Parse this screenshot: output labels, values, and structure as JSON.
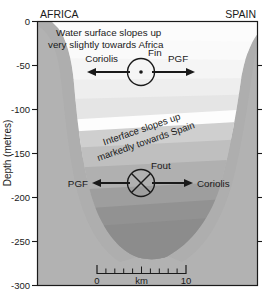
{
  "figure": {
    "type": "cross-section-diagram",
    "background_color": "#ffffff",
    "plot_frame_color": "#1a1a1a",
    "land_color": "#b0b0b0",
    "water_top_color": "#fbfbfb",
    "water_bottom_color": "#8e8e8e"
  },
  "axes": {
    "y_axis_label": "Depth (metres)",
    "y_ticks": [
      "0",
      "-50",
      "-100",
      "-150",
      "-200",
      "-250",
      "-300"
    ],
    "y_tick_values": [
      0,
      -50,
      -100,
      -150,
      -200,
      -250,
      -300
    ],
    "y_range": [
      -300,
      0
    ],
    "x_left_label": "AFRICA",
    "x_right_label": "SPAIN"
  },
  "scale_bar": {
    "start_label": "0",
    "unit_label": "km",
    "end_label": "10",
    "minor_ticks": 10
  },
  "annotations": {
    "surface_note_line1": "Water surface slopes up",
    "surface_note_line2": "very slightly towards Africa",
    "interface_note_line1": "Interface slopes up",
    "interface_note_line2": "markedly towards Spain"
  },
  "force_balance_upper": {
    "marker_label": "Fin",
    "marker_type": "flow-out-of-page",
    "left_force": "Coriolis",
    "right_force": "PGF"
  },
  "force_balance_lower": {
    "marker_label": "Fout",
    "marker_type": "flow-into-page",
    "left_force": "PGF",
    "right_force": "Coriolis"
  },
  "layer_shades": {
    "band_1": "#fcfcfc",
    "band_2": "#f2f2f2",
    "band_3": "#e6e6e6",
    "band_4": "#dadada",
    "band_5": "#cccccc",
    "band_6": "#bdbdbd",
    "band_7": "#aeaeae",
    "band_8": "#9d9d9d",
    "band_9": "#8f8f8f"
  }
}
